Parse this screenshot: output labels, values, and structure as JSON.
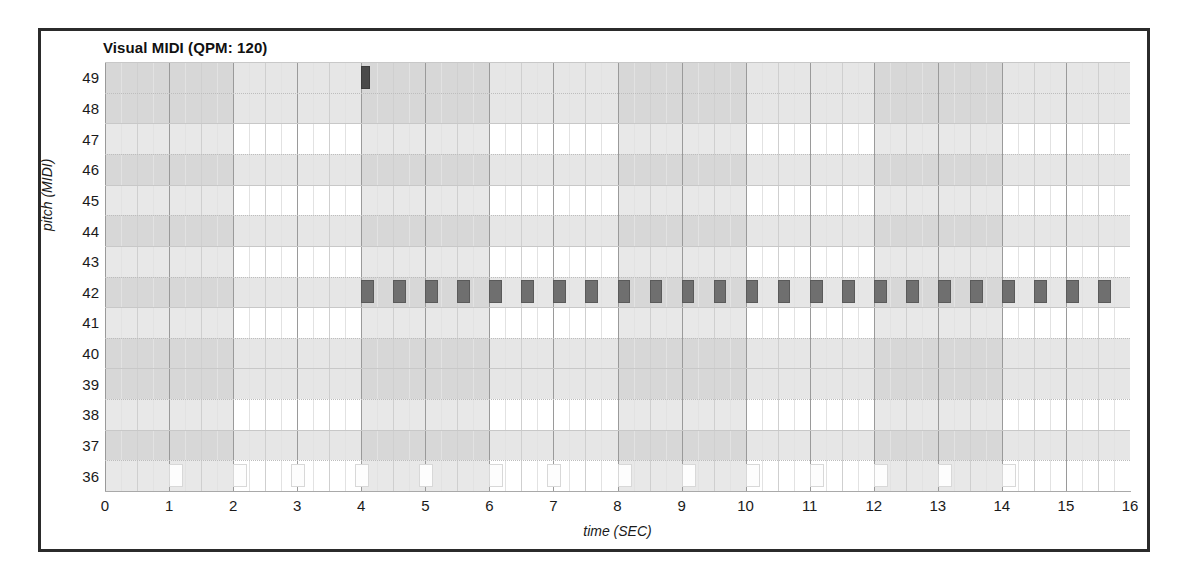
{
  "title": "Visual MIDI (QPM: 120)",
  "axes": {
    "ylabel": "pitch (MIDI)",
    "xlabel": "time (SEC)",
    "yticks": [
      49,
      48,
      47,
      46,
      45,
      44,
      43,
      42,
      41,
      40,
      39,
      38,
      37,
      36
    ],
    "xticks": [
      0,
      1,
      2,
      3,
      4,
      5,
      6,
      7,
      8,
      9,
      10,
      11,
      12,
      13,
      14,
      15,
      16
    ]
  },
  "colors": {
    "frame": "#2b2b2b",
    "note_dark": "#6f6f6f",
    "note_very_dark": "#4a4a4a",
    "note_light": "#fdfdfd",
    "band_dark": "#d2d2d2",
    "band_light": "#ebebeb",
    "gridline": "#9a9a9a"
  },
  "chart_data": {
    "type": "scatter",
    "title": "Visual MIDI (QPM: 120)",
    "xlabel": "time (SEC)",
    "ylabel": "pitch (MIDI)",
    "xlim": [
      0,
      16
    ],
    "ylim": [
      36,
      50
    ],
    "grid": true,
    "legend": "none",
    "qpm": 120,
    "pitch_rows": [
      49,
      48,
      47,
      46,
      45,
      44,
      43,
      42,
      41,
      40,
      39,
      38,
      37,
      36
    ],
    "shaded_pitch_rows": [
      49,
      48,
      46,
      44,
      42,
      40,
      39,
      37
    ],
    "measure_shading_seconds": [
      [
        0,
        2
      ],
      [
        4,
        6
      ],
      [
        8,
        10
      ],
      [
        12,
        14
      ]
    ],
    "series": [
      {
        "name": "pitch-49",
        "pitch": 49,
        "style": "very-dark",
        "notes": [
          {
            "start": 4.0,
            "duration": 0.14
          }
        ]
      },
      {
        "name": "pitch-42",
        "pitch": 42,
        "style": "dark",
        "notes": [
          {
            "start": 4.0,
            "duration": 0.2
          },
          {
            "start": 4.5,
            "duration": 0.2
          },
          {
            "start": 5.0,
            "duration": 0.2
          },
          {
            "start": 5.5,
            "duration": 0.2
          },
          {
            "start": 6.0,
            "duration": 0.2
          },
          {
            "start": 6.5,
            "duration": 0.2
          },
          {
            "start": 7.0,
            "duration": 0.2
          },
          {
            "start": 7.5,
            "duration": 0.2
          },
          {
            "start": 8.0,
            "duration": 0.2
          },
          {
            "start": 8.5,
            "duration": 0.2
          },
          {
            "start": 9.0,
            "duration": 0.2
          },
          {
            "start": 9.5,
            "duration": 0.2
          },
          {
            "start": 10.0,
            "duration": 0.2
          },
          {
            "start": 10.5,
            "duration": 0.2
          },
          {
            "start": 11.0,
            "duration": 0.2
          },
          {
            "start": 11.5,
            "duration": 0.2
          },
          {
            "start": 12.0,
            "duration": 0.2
          },
          {
            "start": 12.5,
            "duration": 0.2
          },
          {
            "start": 13.0,
            "duration": 0.2
          },
          {
            "start": 13.5,
            "duration": 0.2
          },
          {
            "start": 14.0,
            "duration": 0.2
          },
          {
            "start": 14.5,
            "duration": 0.2
          },
          {
            "start": 15.0,
            "duration": 0.2
          },
          {
            "start": 15.5,
            "duration": 0.2
          }
        ]
      },
      {
        "name": "pitch-36",
        "pitch": 36,
        "style": "light",
        "notes": [
          {
            "start": 1.0,
            "duration": 0.22
          },
          {
            "start": 2.0,
            "duration": 0.22
          },
          {
            "start": 2.9,
            "duration": 0.22
          },
          {
            "start": 3.9,
            "duration": 0.22
          },
          {
            "start": 4.9,
            "duration": 0.22
          },
          {
            "start": 6.0,
            "duration": 0.22
          },
          {
            "start": 6.9,
            "duration": 0.22
          },
          {
            "start": 8.0,
            "duration": 0.22
          },
          {
            "start": 9.0,
            "duration": 0.22
          },
          {
            "start": 10.0,
            "duration": 0.22
          },
          {
            "start": 11.0,
            "duration": 0.22
          },
          {
            "start": 12.0,
            "duration": 0.22
          },
          {
            "start": 13.0,
            "duration": 0.22
          },
          {
            "start": 14.0,
            "duration": 0.22
          }
        ]
      }
    ]
  }
}
